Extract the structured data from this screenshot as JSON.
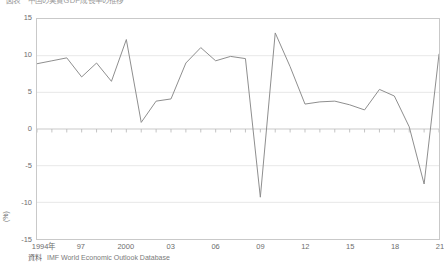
{
  "chart_data": {
    "type": "line",
    "title": "図表　中国の実質GDP成長率の推移",
    "xlabel": "",
    "ylabel": "(%)",
    "ylim": [
      -15,
      15
    ],
    "ytick_labels": [
      "15",
      "10",
      "5",
      "0",
      "-5",
      "-10",
      "-15"
    ],
    "ytick_values": [
      15,
      10,
      5,
      0,
      -5,
      -10,
      -15
    ],
    "xlim": [
      1994,
      2021
    ],
    "xtick_labels": [
      "1994年",
      "97",
      "2000",
      "03",
      "06",
      "09",
      "12",
      "15",
      "18",
      "21"
    ],
    "xtick_values": [
      1994,
      1997,
      2000,
      2003,
      2006,
      2009,
      2012,
      2015,
      2018,
      2021
    ],
    "grid": true,
    "grid_axis": "y",
    "legend": "none",
    "line_color": "#8d8d8d",
    "line_width": 1,
    "x": [
      1994,
      1995,
      1996,
      1997,
      1998,
      1999,
      2000,
      2001,
      2002,
      2003,
      2004,
      2005,
      2006,
      2007,
      2008,
      2009,
      2010,
      2011,
      2012,
      2013,
      2014,
      2015,
      2016,
      2017,
      2018,
      2019,
      2020,
      2021
    ],
    "values": [
      8.9,
      9.3,
      9.7,
      7.1,
      9.0,
      6.5,
      12.2,
      0.9,
      3.8,
      4.1,
      9.0,
      11.1,
      9.3,
      9.9,
      9.6,
      -9.3,
      13.1,
      8.5,
      3.4,
      3.7,
      3.8,
      3.3,
      2.6,
      5.4,
      4.5,
      0.3,
      -7.5,
      10.2
    ],
    "source_label": "資料",
    "source_text": "IMF World Economic Outlook Database"
  },
  "axis": {
    "y_unit": "(%)"
  }
}
